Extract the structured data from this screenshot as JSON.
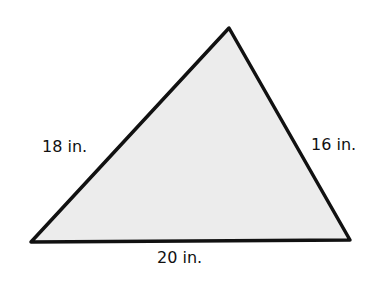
{
  "diagram": {
    "shape": "triangle",
    "fill_color": "#ececec",
    "stroke_color": "#111111",
    "vertices": {
      "top": [
        229,
        28
      ],
      "bottom_left": [
        31,
        242
      ],
      "bottom_right": [
        350,
        240
      ]
    },
    "sides": {
      "left": "18 in.",
      "right": "16 in.",
      "bottom": "20 in."
    }
  }
}
